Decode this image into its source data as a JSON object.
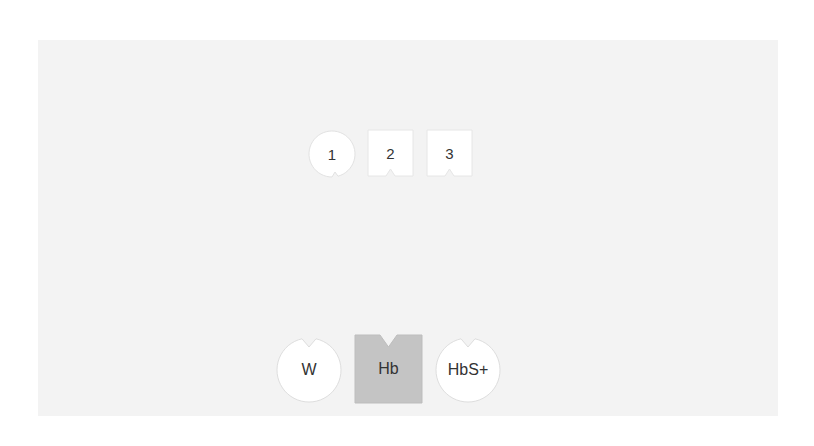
{
  "colors": {
    "background": "#ffffff",
    "panel": "#f3f3f3",
    "piece_fill": "#ffffff",
    "piece_stroke": "#dddddd",
    "selected_fill": "#c4c4c4",
    "text": "#333333"
  },
  "top_row": [
    {
      "label": "1",
      "shape": "circle-notch-bottom",
      "icon": "notched-circle-icon"
    },
    {
      "label": "2",
      "shape": "square-notch-bottom",
      "icon": "notched-square-icon"
    },
    {
      "label": "3",
      "shape": "square-notch-bottom",
      "icon": "notched-square-icon"
    }
  ],
  "bottom_row": [
    {
      "label": "W",
      "shape": "circle-notch-top",
      "icon": "notched-circle-icon"
    },
    {
      "label": "Hb",
      "shape": "square-notch-top",
      "icon": "notched-square-icon",
      "selected": true
    },
    {
      "label": "HbS+",
      "shape": "circle-notch-top",
      "icon": "notched-circle-icon"
    }
  ]
}
